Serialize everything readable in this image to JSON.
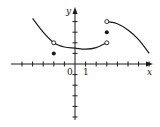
{
  "chart_data": {
    "type": "line",
    "title": "",
    "xlabel": "x",
    "ylabel": "y",
    "tick_labels": {
      "origin": "0",
      "x_one": "1"
    },
    "xlim": [
      -6,
      7.3
    ],
    "ylim": [
      -5.3,
      5.3
    ],
    "grid": false,
    "legend": null,
    "series": [
      {
        "name": "left-piece",
        "style": "curve",
        "points": [
          [
            -4,
            4.3
          ],
          [
            -3,
            3.0
          ],
          [
            -2,
            2.0
          ],
          [
            -1,
            1.6
          ],
          [
            0,
            1.5
          ],
          [
            1,
            1.4
          ],
          [
            2,
            1.55
          ],
          [
            3,
            2.0
          ]
        ],
        "start": {
          "x": -4,
          "y": 4.3,
          "marker": "none"
        },
        "end": {
          "x": 3,
          "y": 2,
          "marker": "open"
        }
      },
      {
        "name": "right-piece",
        "style": "curve",
        "points": [
          [
            3,
            4
          ],
          [
            4,
            3.8
          ],
          [
            5,
            3.2
          ],
          [
            6,
            2.3
          ],
          [
            7,
            1.0
          ]
        ],
        "start": {
          "x": 3,
          "y": 4,
          "marker": "open"
        },
        "end": {
          "x": 7,
          "y": 1.0,
          "marker": "none"
        }
      }
    ],
    "open_points": [
      {
        "x": -2,
        "y": 2
      },
      {
        "x": 3,
        "y": 2
      },
      {
        "x": 3,
        "y": 4
      }
    ],
    "closed_points": [
      {
        "x": -2,
        "y": 1
      },
      {
        "x": 3,
        "y": 3
      }
    ],
    "x_ticks": [
      -5,
      -4,
      -3,
      -2,
      -1,
      1,
      2,
      3,
      4,
      5,
      6,
      7
    ],
    "y_ticks": [
      -5,
      -4,
      -3,
      -2,
      -1,
      1,
      2,
      3,
      4
    ]
  }
}
